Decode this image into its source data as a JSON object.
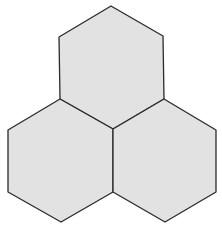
{
  "diagram": {
    "shapes": [
      {
        "name": "hexagon-top",
        "fill": "#e2e2e2",
        "stroke": "#2a2a2a"
      },
      {
        "name": "hexagon-bottom-left",
        "fill": "#e2e2e2",
        "stroke": "#2a2a2a"
      },
      {
        "name": "hexagon-bottom-right",
        "fill": "#e2e2e2",
        "stroke": "#2a2a2a"
      }
    ]
  }
}
